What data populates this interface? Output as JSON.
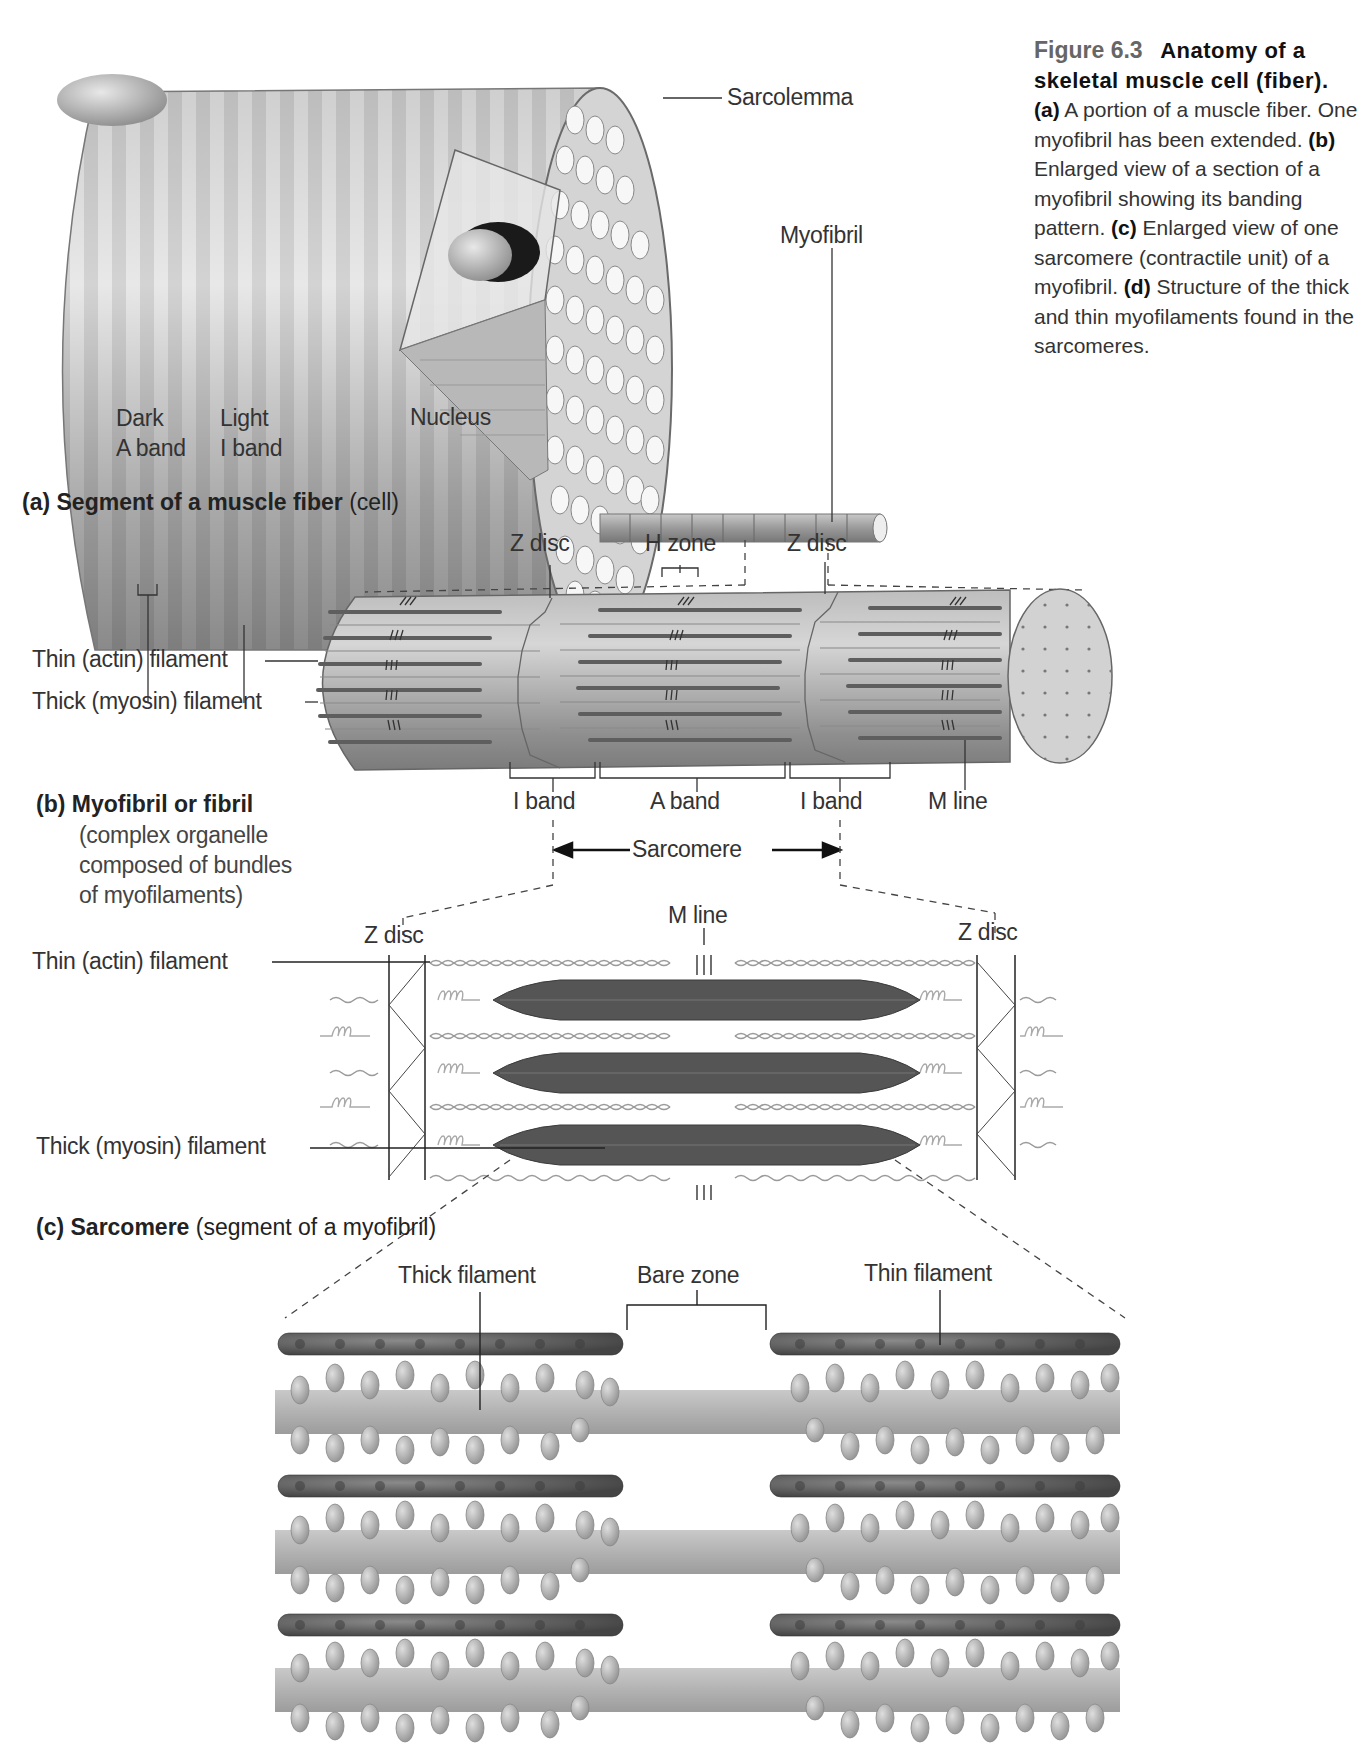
{
  "caption": {
    "figure_number": "Figure 6.3",
    "title_line1": "Anatomy of a",
    "title_line2": "skeletal muscle cell (fiber).",
    "parts": [
      {
        "key": "(a)",
        "text": " A portion of a muscle fiber. One myofibril has been extended. "
      },
      {
        "key": "(b)",
        "text": " Enlarged view of a section of a myofibril showing its banding pattern. "
      },
      {
        "key": "(c)",
        "text": " Enlarged view of one sarcomere (contractile unit) of a myofibril. "
      },
      {
        "key": "(d)",
        "text": " Structure of the thick and thin myofilaments found in the sarcomeres."
      }
    ]
  },
  "panel_a": {
    "title_bold": "(a) Segment of a muscle fiber",
    "title_normal": " (cell)",
    "labels": {
      "sarcolemma": "Sarcolemma",
      "myofibril": "Myofibril",
      "dark": "Dark",
      "a_band": "A band",
      "light": "Light",
      "i_band": "I band",
      "nucleus": "Nucleus"
    }
  },
  "panel_b": {
    "title_bold": "(b) Myofibril or fibril",
    "subtitle_lines": [
      "(complex organelle",
      "composed of bundles",
      "of myofilaments)"
    ],
    "labels": {
      "z_disc_left": "Z disc",
      "h_zone": "H zone",
      "z_disc_right": "Z disc",
      "thin_filament": "Thin (actin) filament",
      "thick_filament": "Thick (myosin) filament",
      "i_band_left": "I band",
      "a_band": "A band",
      "i_band_right": "I band",
      "m_line": "M line",
      "sarcomere": "Sarcomere"
    }
  },
  "panel_c": {
    "title_bold": "(c) Sarcomere",
    "title_normal": " (segment of a myofibril)",
    "labels": {
      "z_disc_left": "Z disc",
      "m_line": "M line",
      "z_disc_right": "Z disc",
      "thin_filament": "Thin (actin) filament",
      "thick_filament": "Thick (myosin) filament"
    }
  },
  "panel_d": {
    "labels": {
      "thick_filament": "Thick filament",
      "bare_zone": "Bare zone",
      "thin_filament": "Thin filament"
    }
  },
  "colors": {
    "fiber_light": "#e2e2e2",
    "fiber_dark": "#8e8e8e",
    "filament_dark": "#555555",
    "myosin_head": "#a8a8a8",
    "text": "#333333",
    "figure_number": "#666666"
  }
}
